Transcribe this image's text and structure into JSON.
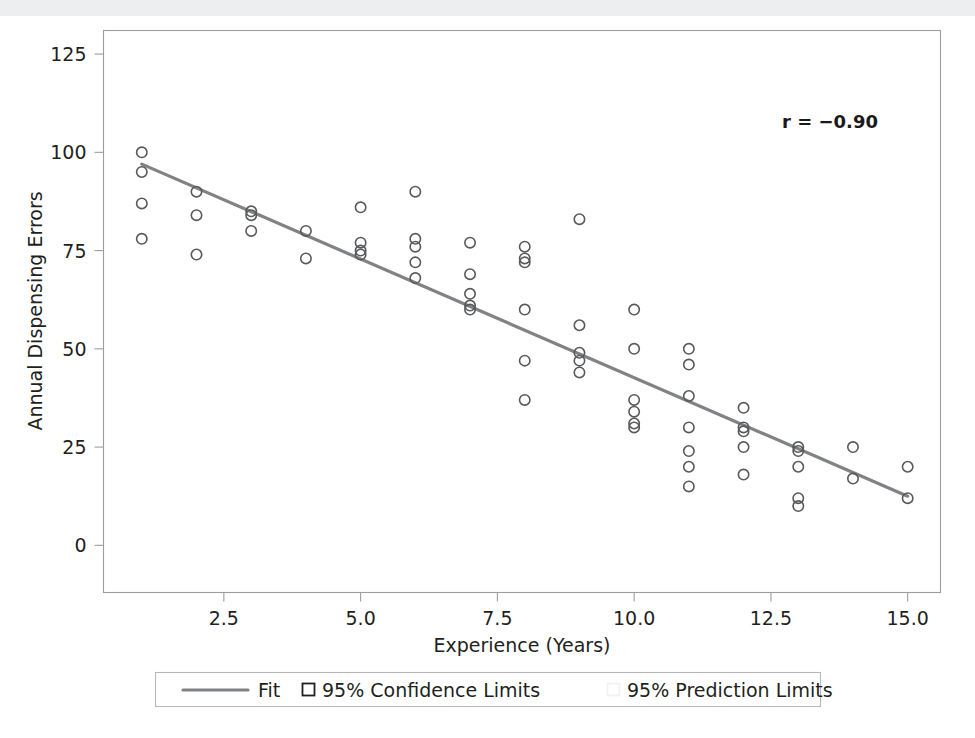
{
  "chart_data": {
    "type": "scatter",
    "title": "",
    "xlabel": "Experience (Years)",
    "ylabel": "Annual Dispensing Errors",
    "xlim": [
      0.3,
      15.6
    ],
    "ylim": [
      -12,
      131
    ],
    "xticks": [
      "2.5",
      "5.0",
      "7.5",
      "10.0",
      "12.5",
      "15.0"
    ],
    "xtick_values": [
      2.5,
      5.0,
      7.5,
      10.0,
      12.5,
      15.0
    ],
    "yticks": [
      "0",
      "25",
      "50",
      "75",
      "100",
      "125"
    ],
    "ytick_values": [
      0,
      25,
      50,
      75,
      100,
      125
    ],
    "grid": false,
    "annotation": "r = −0.90",
    "correlation": -0.9,
    "fit_line": {
      "name": "Fit",
      "x_start": 1.0,
      "y_start": 97.0,
      "x_end": 15.0,
      "y_end": 12.5,
      "slope": -6.036,
      "intercept": 103.04,
      "color": "#808285"
    },
    "series": [
      {
        "name": "Observations",
        "marker": "open-circle",
        "color": "#58595b",
        "points": [
          [
            1,
            100
          ],
          [
            1,
            95
          ],
          [
            1,
            87
          ],
          [
            1,
            78
          ],
          [
            2,
            90
          ],
          [
            2,
            84
          ],
          [
            2,
            74
          ],
          [
            3,
            85
          ],
          [
            3,
            84
          ],
          [
            3,
            80
          ],
          [
            4,
            80
          ],
          [
            4,
            73
          ],
          [
            5,
            86
          ],
          [
            5,
            77
          ],
          [
            5,
            75
          ],
          [
            5,
            74
          ],
          [
            6,
            90
          ],
          [
            6,
            78
          ],
          [
            6,
            76
          ],
          [
            6,
            72
          ],
          [
            6,
            68
          ],
          [
            7,
            77
          ],
          [
            7,
            69
          ],
          [
            7,
            64
          ],
          [
            7,
            61
          ],
          [
            7,
            60
          ],
          [
            8,
            76
          ],
          [
            8,
            73
          ],
          [
            8,
            72
          ],
          [
            8,
            60
          ],
          [
            8,
            47
          ],
          [
            8,
            37
          ],
          [
            9,
            83
          ],
          [
            9,
            56
          ],
          [
            9,
            49
          ],
          [
            9,
            47
          ],
          [
            9,
            44
          ],
          [
            10,
            60
          ],
          [
            10,
            50
          ],
          [
            10,
            37
          ],
          [
            10,
            34
          ],
          [
            10,
            31
          ],
          [
            10,
            30
          ],
          [
            11,
            50
          ],
          [
            11,
            46
          ],
          [
            11,
            38
          ],
          [
            11,
            30
          ],
          [
            11,
            24
          ],
          [
            11,
            20
          ],
          [
            11,
            15
          ],
          [
            12,
            35
          ],
          [
            12,
            30
          ],
          [
            12,
            29
          ],
          [
            12,
            25
          ],
          [
            12,
            18
          ],
          [
            13,
            25
          ],
          [
            13,
            24
          ],
          [
            13,
            20
          ],
          [
            13,
            12
          ],
          [
            13,
            10
          ],
          [
            14,
            25
          ],
          [
            14,
            17
          ],
          [
            15,
            20
          ],
          [
            15,
            12
          ]
        ]
      }
    ],
    "legend": {
      "position": "bottom",
      "entries": [
        {
          "label": "Fit",
          "marker": "line",
          "color": "#808285"
        },
        {
          "label": "95% Confidence Limits",
          "marker": "square",
          "color": "#231f20"
        },
        {
          "label": "95% Prediction Limits",
          "marker": "square-faint",
          "color": "#f2f2f2"
        }
      ]
    }
  },
  "axes": {
    "y_title": "Annual Dispensing Errors",
    "x_title": "Experience (Years)"
  },
  "annotation": {
    "r_label": "r = −0.90"
  },
  "legend": {
    "fit": "Fit",
    "confidence": "95% Confidence Limits",
    "prediction": "95% Prediction Limits"
  },
  "ticks": {
    "y": [
      "125",
      "100",
      "75",
      "50",
      "25",
      "0"
    ],
    "x": [
      "2.5",
      "5.0",
      "7.5",
      "10.0",
      "12.5",
      "15.0"
    ]
  }
}
